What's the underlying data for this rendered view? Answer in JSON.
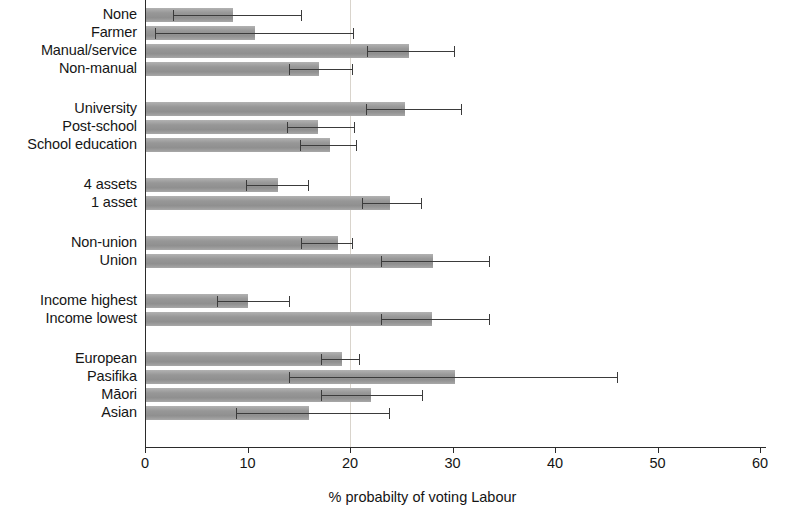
{
  "chart_data": {
    "type": "bar",
    "orientation": "horizontal",
    "title": "",
    "xlabel": "% probabilty of voting Labour",
    "ylabel": "",
    "xlim": [
      0,
      60
    ],
    "xticks": [
      0,
      10,
      20,
      30,
      40,
      50,
      60
    ],
    "xtick_labels": [
      "0",
      "10",
      "20",
      "30",
      "40",
      "50",
      "60"
    ],
    "grid": true,
    "gridlines": [
      20
    ],
    "legend": "none",
    "bar_color": "#9d9d9d",
    "error_color": "#3b3b3b",
    "error_bars": true,
    "categories": [
      "None",
      "Farmer",
      "Manual/service",
      "Non-manual",
      "University",
      "Post-school",
      "School education",
      "4 assets",
      "1 asset",
      "Non-union",
      "Union",
      "Income highest",
      "Income lowest",
      "European",
      "Pasifika",
      "Māori",
      "Asian"
    ],
    "groups": [
      {
        "name": "occupation",
        "items": [
          {
            "label": "None",
            "value": 8.6,
            "ci_low": 2.7,
            "ci_high": 15.2
          },
          {
            "label": "Farmer",
            "value": 10.7,
            "ci_low": 1.0,
            "ci_high": 20.3
          },
          {
            "label": "Manual/service",
            "value": 25.8,
            "ci_low": 21.7,
            "ci_high": 30.1
          },
          {
            "label": "Non-manual",
            "value": 17.0,
            "ci_low": 14.0,
            "ci_high": 20.2
          }
        ]
      },
      {
        "name": "education",
        "items": [
          {
            "label": "University",
            "value": 25.4,
            "ci_low": 21.6,
            "ci_high": 30.8
          },
          {
            "label": "Post-school",
            "value": 16.9,
            "ci_low": 13.9,
            "ci_high": 20.4
          },
          {
            "label": "School education",
            "value": 18.0,
            "ci_low": 15.1,
            "ci_high": 20.6
          }
        ]
      },
      {
        "name": "assets",
        "items": [
          {
            "label": "4 assets",
            "value": 13.0,
            "ci_low": 9.9,
            "ci_high": 15.9
          },
          {
            "label": "1 asset",
            "value": 23.9,
            "ci_low": 21.2,
            "ci_high": 26.9
          }
        ]
      },
      {
        "name": "union",
        "items": [
          {
            "label": "Non-union",
            "value": 18.8,
            "ci_low": 15.2,
            "ci_high": 20.2
          },
          {
            "label": "Union",
            "value": 28.1,
            "ci_low": 23.0,
            "ci_high": 33.6
          }
        ]
      },
      {
        "name": "income",
        "items": [
          {
            "label": "Income highest",
            "value": 10.0,
            "ci_low": 7.0,
            "ci_high": 14.0
          },
          {
            "label": "Income lowest",
            "value": 28.0,
            "ci_low": 23.0,
            "ci_high": 33.6
          }
        ]
      },
      {
        "name": "ethnicity",
        "items": [
          {
            "label": "European",
            "value": 19.2,
            "ci_low": 17.2,
            "ci_high": 20.9
          },
          {
            "label": "Pasifika",
            "value": 30.2,
            "ci_low": 14.0,
            "ci_high": 46.0
          },
          {
            "label": "Māori",
            "value": 22.0,
            "ci_low": 17.2,
            "ci_high": 27.0
          },
          {
            "label": "Asian",
            "value": 16.0,
            "ci_low": 8.9,
            "ci_high": 23.8
          }
        ]
      }
    ]
  },
  "axis": {
    "x_title": "% probabilty of voting Labour",
    "tick_labels": [
      "0",
      "10",
      "20",
      "30",
      "40",
      "50",
      "60"
    ]
  }
}
